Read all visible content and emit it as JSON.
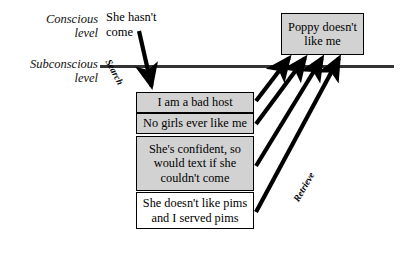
{
  "diagram": {
    "levels": [
      {
        "id": "conscious",
        "label": "Conscious\nlevel",
        "line1": "Conscious",
        "line2": "level"
      },
      {
        "id": "subconscious",
        "label": "Subconscious\nlevel",
        "line1": "Subconscious",
        "line2": "level"
      }
    ],
    "conscious_thought": {
      "line1": "She hasn't",
      "line2": "come",
      "text": "She hasn't come"
    },
    "conclusion_box": {
      "line1": "Poppy doesn't",
      "line2": "like me",
      "text": "Poppy doesn't like me",
      "fill": "#d2d2d2"
    },
    "subconscious_boxes": [
      {
        "id": "bad-host",
        "line1": "I am a bad host",
        "line2": "",
        "text": "I am a bad host",
        "fill": "#d2d2d2"
      },
      {
        "id": "no-girls",
        "line1": "No girls ever like me",
        "line2": "",
        "text": "No girls ever like me",
        "fill": "#d2d2d2"
      },
      {
        "id": "confident",
        "line1": "She's confident, so",
        "line2": "would text if she",
        "line3": "couldn't come",
        "text": "She's confident, so would text if she couldn't come",
        "fill": "#d2d2d2"
      },
      {
        "id": "pims",
        "line1": "She doesn't like pims",
        "line2": "and I served pims",
        "text": "She doesn't like pims and I served pims",
        "fill": "#ffffff"
      }
    ],
    "edges": [
      {
        "id": "search",
        "label": "Search",
        "direction": "down"
      },
      {
        "id": "retrieve",
        "label": "Retrieve",
        "direction": "up"
      }
    ],
    "colors": {
      "box_fill_gray": "#d2d2d2",
      "box_fill_white": "#ffffff",
      "box_border": "#000000",
      "divider": "#333333",
      "arrow": "#000000",
      "text": "#000000"
    }
  }
}
